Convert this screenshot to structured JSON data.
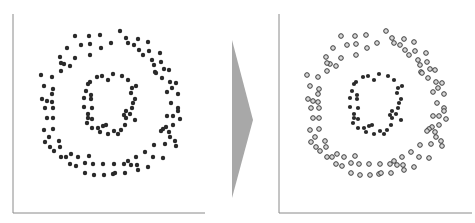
{
  "diagram": {
    "arrow_color": "#a8a8a8",
    "axis_color": "#8a8a8a",
    "left_panel": {
      "state": "unclustered",
      "point_style": "filled",
      "point_color": "#2a2a2a"
    },
    "right_panel": {
      "state": "clustered",
      "clusters": [
        {
          "name": "outer-ring",
          "point_style": "hollow",
          "stroke": "#3a3a3a",
          "fill": "#d8d8d8"
        },
        {
          "name": "inner-ring",
          "point_style": "filled",
          "fill": "#2a2a2a"
        }
      ]
    },
    "outer_points": [
      [
        75,
        36
      ],
      [
        89,
        36
      ],
      [
        100,
        35
      ],
      [
        120,
        31
      ],
      [
        67,
        48
      ],
      [
        81,
        45
      ],
      [
        90,
        44
      ],
      [
        111,
        43
      ],
      [
        128,
        43
      ],
      [
        138,
        39
      ],
      [
        134,
        45
      ],
      [
        126,
        38
      ],
      [
        148,
        42
      ],
      [
        90,
        55
      ],
      [
        101,
        48
      ],
      [
        60,
        57
      ],
      [
        75,
        58
      ],
      [
        64,
        64
      ],
      [
        70,
        66
      ],
      [
        139,
        50
      ],
      [
        143,
        55
      ],
      [
        149,
        51
      ],
      [
        160,
        53
      ],
      [
        152,
        60
      ],
      [
        154,
        65
      ],
      [
        161,
        62
      ],
      [
        61,
        63
      ],
      [
        41,
        75
      ],
      [
        52,
        77
      ],
      [
        61,
        71
      ],
      [
        155,
        72
      ],
      [
        164,
        69
      ],
      [
        169,
        70
      ],
      [
        156,
        73
      ],
      [
        170,
        82
      ],
      [
        162,
        78
      ],
      [
        176,
        83
      ],
      [
        44,
        86
      ],
      [
        53,
        89
      ],
      [
        52,
        94
      ],
      [
        172,
        88
      ],
      [
        167,
        92
      ],
      [
        178,
        94
      ],
      [
        42,
        99
      ],
      [
        47,
        101
      ],
      [
        52,
        102
      ],
      [
        45,
        108
      ],
      [
        53,
        108
      ],
      [
        171,
        103
      ],
      [
        178,
        108
      ],
      [
        47,
        118
      ],
      [
        53,
        118
      ],
      [
        178,
        111
      ],
      [
        180,
        119
      ],
      [
        167,
        116
      ],
      [
        173,
        116
      ],
      [
        44,
        130
      ],
      [
        53,
        129
      ],
      [
        173,
        125
      ],
      [
        166,
        127
      ],
      [
        163,
        129
      ],
      [
        161,
        131
      ],
      [
        169,
        132
      ],
      [
        49,
        137
      ],
      [
        45,
        142
      ],
      [
        59,
        141
      ],
      [
        60,
        147
      ],
      [
        170,
        137
      ],
      [
        175,
        141
      ],
      [
        165,
        144
      ],
      [
        50,
        147
      ],
      [
        54,
        151
      ],
      [
        176,
        146
      ],
      [
        154,
        145
      ],
      [
        145,
        152
      ],
      [
        153,
        157
      ],
      [
        163,
        158
      ],
      [
        66,
        157
      ],
      [
        71,
        154
      ],
      [
        61,
        157
      ],
      [
        78,
        157
      ],
      [
        89,
        156
      ],
      [
        70,
        164
      ],
      [
        76,
        166
      ],
      [
        85,
        163
      ],
      [
        93,
        164
      ],
      [
        103,
        164
      ],
      [
        114,
        164
      ],
      [
        124,
        164
      ],
      [
        128,
        161
      ],
      [
        136,
        157
      ],
      [
        148,
        167
      ],
      [
        131,
        165
      ],
      [
        137,
        165
      ],
      [
        138,
        170
      ],
      [
        85,
        173
      ],
      [
        94,
        175
      ],
      [
        104,
        175
      ],
      [
        113,
        174
      ],
      [
        115,
        173
      ],
      [
        125,
        173
      ]
    ],
    "inner_points": [
      [
        97,
        77
      ],
      [
        102,
        76
      ],
      [
        113,
        74
      ],
      [
        122,
        76
      ],
      [
        108,
        80
      ],
      [
        128,
        80
      ],
      [
        90,
        82
      ],
      [
        88,
        84
      ],
      [
        132,
        88
      ],
      [
        136,
        86
      ],
      [
        86,
        91
      ],
      [
        91,
        95
      ],
      [
        131,
        93
      ],
      [
        135,
        99
      ],
      [
        84,
        98
      ],
      [
        91,
        99
      ],
      [
        133,
        103
      ],
      [
        132,
        108
      ],
      [
        84,
        107
      ],
      [
        92,
        108
      ],
      [
        126,
        111
      ],
      [
        130,
        114
      ],
      [
        88,
        114
      ],
      [
        88,
        118
      ],
      [
        92,
        119
      ],
      [
        124,
        115
      ],
      [
        135,
        120
      ],
      [
        87,
        123
      ],
      [
        92,
        128
      ],
      [
        98,
        128
      ],
      [
        103,
        126
      ],
      [
        106,
        125
      ],
      [
        100,
        132
      ],
      [
        108,
        134
      ],
      [
        114,
        131
      ],
      [
        118,
        134
      ],
      [
        121,
        130
      ],
      [
        125,
        125
      ],
      [
        126,
        118
      ]
    ]
  }
}
